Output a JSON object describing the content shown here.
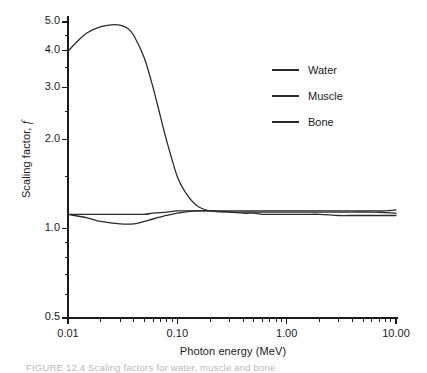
{
  "chart_data": {
    "type": "line",
    "title": "",
    "xlabel": "Photon energy (MeV)",
    "ylabel": "Scaling factor, f",
    "xscale": "log",
    "yscale": "log",
    "xlim": [
      0.01,
      10.0
    ],
    "ylim": [
      0.5,
      5.0
    ],
    "grid": false,
    "legend_position": "upper-right",
    "xticks": [
      {
        "value": 0.01,
        "label": "0.01"
      },
      {
        "value": 0.1,
        "label": "0.10"
      },
      {
        "value": 1.0,
        "label": "1.00"
      },
      {
        "value": 10.0,
        "label": "10.00"
      }
    ],
    "yticks": [
      {
        "value": 0.5,
        "label": "0.5"
      },
      {
        "value": 1.0,
        "label": "1.0"
      },
      {
        "value": 2.0,
        "label": "2.0"
      },
      {
        "value": 3.0,
        "label": "3.0"
      },
      {
        "value": 4.0,
        "label": "4.0"
      },
      {
        "value": 5.0,
        "label": "5.0"
      }
    ],
    "yminorticks": [
      0.6,
      0.7,
      0.8,
      0.9,
      1.5,
      2.5,
      3.5,
      4.5
    ],
    "series": [
      {
        "name": "Water",
        "color": "#2b2b2b",
        "x": [
          0.01,
          0.015,
          0.02,
          0.03,
          0.04,
          0.05,
          0.06,
          0.08,
          0.1,
          0.15,
          0.2,
          0.3,
          0.4,
          0.5,
          0.6,
          0.8,
          1.0,
          1.5,
          2.0,
          3.0,
          4.0,
          5.0,
          6.0,
          8.0,
          10.0
        ],
        "y": [
          1.12,
          1.12,
          1.12,
          1.12,
          1.12,
          1.12,
          1.13,
          1.14,
          1.15,
          1.15,
          1.15,
          1.15,
          1.15,
          1.15,
          1.15,
          1.15,
          1.15,
          1.15,
          1.15,
          1.15,
          1.15,
          1.15,
          1.15,
          1.15,
          1.16
        ]
      },
      {
        "name": "Muscle",
        "color": "#2b2b2b",
        "x": [
          0.01,
          0.015,
          0.02,
          0.03,
          0.04,
          0.05,
          0.06,
          0.08,
          0.1,
          0.15,
          0.2,
          0.3,
          0.4,
          0.5,
          0.6,
          0.8,
          1.0,
          1.5,
          2.0,
          3.0,
          4.0,
          5.0,
          6.0,
          8.0,
          10.0
        ],
        "y": [
          1.12,
          1.09,
          1.06,
          1.04,
          1.04,
          1.06,
          1.08,
          1.11,
          1.13,
          1.15,
          1.15,
          1.14,
          1.13,
          1.13,
          1.12,
          1.12,
          1.12,
          1.12,
          1.12,
          1.11,
          1.11,
          1.11,
          1.11,
          1.11,
          1.11
        ]
      },
      {
        "name": "Bone",
        "color": "#2b2b2b",
        "x": [
          0.01,
          0.012,
          0.015,
          0.02,
          0.025,
          0.03,
          0.035,
          0.04,
          0.05,
          0.06,
          0.07,
          0.08,
          0.1,
          0.12,
          0.15,
          0.2,
          0.3,
          0.4,
          0.6,
          0.8,
          1.0,
          2.0,
          4.0,
          6.0,
          10.0
        ],
        "y": [
          3.98,
          4.28,
          4.6,
          4.82,
          4.89,
          4.88,
          4.76,
          4.5,
          3.77,
          3.0,
          2.4,
          1.98,
          1.5,
          1.32,
          1.2,
          1.15,
          1.14,
          1.14,
          1.14,
          1.14,
          1.14,
          1.14,
          1.14,
          1.14,
          1.13
        ]
      }
    ],
    "legend_entries": [
      "Water",
      "Muscle",
      "Bone"
    ],
    "axis_color": "#1a1a1a",
    "line_color": "#2b2b2b"
  },
  "figure": {
    "caption": "FIGURE 12.4  Scaling factors for water, muscle and bone"
  }
}
